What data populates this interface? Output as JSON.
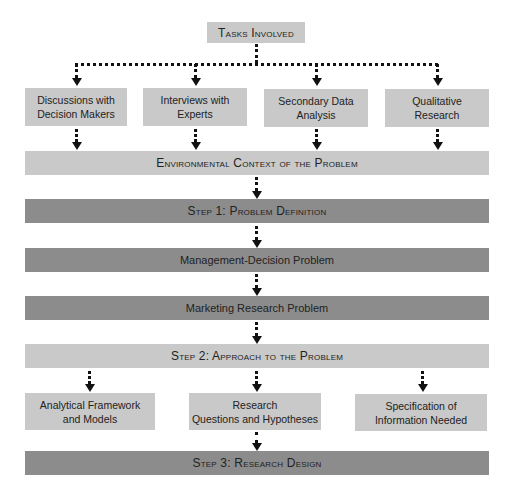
{
  "title": "Tasks Involved",
  "tasks": [
    {
      "label": "Discussions with\nDecision Makers"
    },
    {
      "label": "Interviews with\nExperts"
    },
    {
      "label": "Secondary Data\nAnalysis"
    },
    {
      "label": "Qualitative\nResearch"
    }
  ],
  "environmental_context": "Environmental Context of the Problem",
  "step1": "Step 1: Problem Definition",
  "management_decision_problem": "Management-Decision Problem",
  "marketing_research_problem": "Marketing Research Problem",
  "step2": "Step 2: Approach to the Problem",
  "approach_components": [
    {
      "label": "Analytical Framework\nand Models"
    },
    {
      "label": "Research\nQuestions and Hypotheses"
    },
    {
      "label": "Specification of\nInformation Needed"
    }
  ],
  "step3": "Step 3: Research Design",
  "colors": {
    "light_box": "#c9c9c9",
    "dark_box": "#8c8c8c",
    "connector": "#111111"
  }
}
